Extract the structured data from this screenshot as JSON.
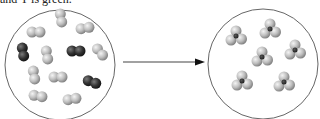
{
  "caption": "and Y is green.",
  "colors": {
    "atom_light": "#c8c8c8",
    "atom_dark": "#3a3a3a",
    "circle_stroke": "#666666",
    "arrow": "#333333"
  },
  "diagram": {
    "left_container": {
      "label": "reactants",
      "molecules": [
        {
          "type": "Y2",
          "color": "light",
          "x": 61,
          "y": 18,
          "angle": 80
        },
        {
          "type": "Y2",
          "color": "light",
          "x": 36,
          "y": 32,
          "angle": 0
        },
        {
          "type": "Y2",
          "color": "light",
          "x": 85,
          "y": 28,
          "angle": -10
        },
        {
          "type": "X2",
          "color": "dark",
          "x": 23,
          "y": 52,
          "angle": 80
        },
        {
          "type": "Y2",
          "color": "light",
          "x": 47,
          "y": 55,
          "angle": 80
        },
        {
          "type": "X2",
          "color": "dark",
          "x": 76,
          "y": 51,
          "angle": 0
        },
        {
          "type": "Y2",
          "color": "light",
          "x": 100,
          "y": 52,
          "angle": 50
        },
        {
          "type": "Y2",
          "color": "light",
          "x": 34,
          "y": 75,
          "angle": 80
        },
        {
          "type": "Y2",
          "color": "light",
          "x": 58,
          "y": 77,
          "angle": 0
        },
        {
          "type": "X2",
          "color": "dark",
          "x": 92,
          "y": 82,
          "angle": 20
        },
        {
          "type": "Y2",
          "color": "light",
          "x": 38,
          "y": 96,
          "angle": 10
        },
        {
          "type": "Y2",
          "color": "light",
          "x": 72,
          "y": 99,
          "angle": -10
        }
      ]
    },
    "right_container": {
      "label": "products",
      "molecules": [
        {
          "type": "XY3",
          "x": 236,
          "y": 36
        },
        {
          "type": "XY3",
          "x": 270,
          "y": 29
        },
        {
          "type": "XY3",
          "x": 295,
          "y": 50
        },
        {
          "type": "XY3",
          "x": 262,
          "y": 57
        },
        {
          "type": "XY3",
          "x": 242,
          "y": 81
        },
        {
          "type": "XY3",
          "x": 284,
          "y": 82
        }
      ]
    },
    "arrow": {
      "x1": 123,
      "y1": 62,
      "x2": 205,
      "y2": 62
    }
  }
}
